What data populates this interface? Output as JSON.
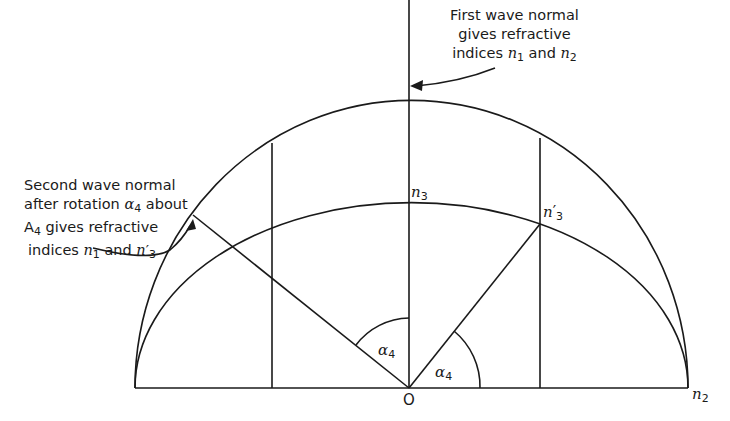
{
  "figure": {
    "annotations": {
      "first_wave": {
        "line1": "First wave normal",
        "line2": "gives refractive",
        "line3_prefix": "indices ",
        "n1": "n",
        "n1_sub": "1",
        "and": " and ",
        "n2": "n",
        "n2_sub": "2"
      },
      "second_wave": {
        "line1": "Second wave normal",
        "line2_prefix": "after rotation ",
        "alpha": "α",
        "alpha_sub": "4",
        "line2_suffix": " about",
        "line3_A": "A",
        "line3_A_sub": "4",
        "line3_suffix": " gives refractive",
        "line4_prefix": "indices ",
        "n1": "n",
        "n1_sub": "1",
        "and": " and ",
        "n3p": "n",
        "n3p_prime": "′",
        "n3p_sub": "3"
      }
    },
    "points": {
      "n3": {
        "symbol": "n",
        "sub": "3"
      },
      "n3_prime": {
        "symbol": "n",
        "prime": "′",
        "sub": "3"
      },
      "origin": {
        "label": "O"
      },
      "n2": {
        "symbol": "n",
        "sub": "2"
      }
    },
    "angles": [
      {
        "symbol": "α",
        "sub": "4",
        "position": "between second wave normal and vertical axis"
      },
      {
        "symbol": "α",
        "sub": "4",
        "position": "between baseline and line to n′3"
      }
    ],
    "stroke_color": "#1a1a1a",
    "background": "#ffffff"
  }
}
